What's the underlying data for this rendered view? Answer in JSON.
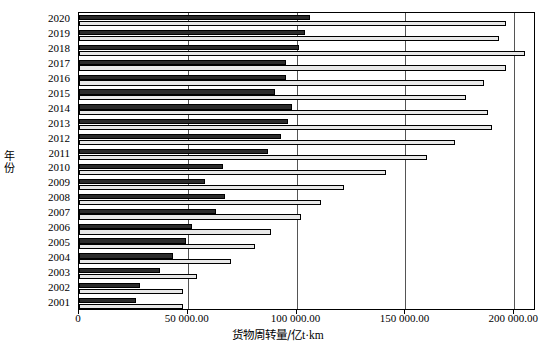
{
  "chart_data": {
    "type": "bar",
    "orientation": "horizontal",
    "title": "",
    "xlabel": "货物周转量/亿t·km",
    "ylabel": "年份",
    "xlim": [
      0,
      210000
    ],
    "xticks": [
      0,
      50000,
      100000,
      150000,
      200000
    ],
    "xticklabels": [
      "0",
      "50 000.00",
      "100 000.00",
      "150 000.00",
      "200 000.00"
    ],
    "grid": true,
    "legend": "none",
    "categories": [
      "2020",
      "2019",
      "2018",
      "2017",
      "2016",
      "2015",
      "2014",
      "2013",
      "2012",
      "2011",
      "2010",
      "2009",
      "2008",
      "2007",
      "2006",
      "2005",
      "2004",
      "2003",
      "2002",
      "2001"
    ],
    "series": [
      {
        "name": "series-dark",
        "color": "#2b2b2b",
        "values": [
          106000,
          104000,
          101000,
          95000,
          95000,
          90000,
          98000,
          96000,
          93000,
          87000,
          66000,
          58000,
          67000,
          63000,
          52000,
          49000,
          43000,
          37000,
          28000,
          26000
        ]
      },
      {
        "name": "series-light",
        "color": "#e8e8e8",
        "values": [
          196000,
          193000,
          205000,
          196000,
          186000,
          178000,
          188000,
          190000,
          173000,
          160000,
          141000,
          122000,
          111000,
          102000,
          88000,
          81000,
          70000,
          54000,
          48000,
          48000
        ]
      }
    ]
  },
  "axes": {
    "y_title": "年份",
    "x_title_main": "货物周转量/",
    "x_title_unit": "亿t·km"
  }
}
